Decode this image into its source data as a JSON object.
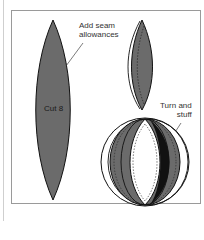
{
  "diagram": {
    "title": "",
    "labels": {
      "add_seam_line1": "Add seam",
      "add_seam_line2": "allowances",
      "cut": "Cut 8",
      "turn_line1": "Turn and",
      "turn_line2": "stuff"
    },
    "colors": {
      "fill": "#6b6b6b",
      "outline": "#111111",
      "frame": "#9a9a9a",
      "background": "#ffffff"
    },
    "shapes": [
      {
        "name": "pattern-piece",
        "description": "single gore pattern piece"
      },
      {
        "name": "seamed-gore",
        "description": "gore with seam allowance and stitching"
      },
      {
        "name": "assembled-ball",
        "description": "ball of gores turned and stuffed"
      }
    ]
  }
}
